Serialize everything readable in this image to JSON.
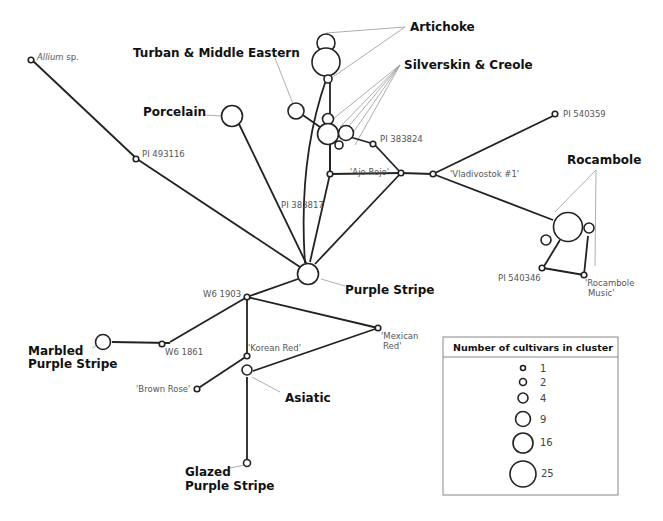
{
  "diagram": {
    "type": "minimum-spanning-network",
    "groups": {
      "artichoke": "Artichoke",
      "turban": "Turban & Middle Eastern",
      "silverskin": "Silverskin & Creole",
      "porcelain": "Porcelain",
      "rocambole": "Rocambole",
      "purple_stripe": "Purple Stripe",
      "marbled_1": "Marbled",
      "marbled_2": "Purple Stripe",
      "asiatic": "Asiatic",
      "glazed_1": "Glazed",
      "glazed_2": "Purple Stripe"
    },
    "accessions": {
      "allium": "Allium",
      "allium_suffix": " sp.",
      "pi493116": "PI 493116",
      "pi383824": "PI 383824",
      "ajo_rojo": "'Ajo Rojo'",
      "vladivostok": "'Vladivostok #1'",
      "pi540359": "PI 540359",
      "pi383817": "PI 383817",
      "pi540346": "PI 540346",
      "rocambole_music_1": "'Rocambole",
      "rocambole_music_2": "Music'",
      "w6_1903": "W6 1903",
      "w6_1861": "W6 1861",
      "korean_red": "'Korean Red'",
      "mexican_red_1": "'Mexican",
      "mexican_red_2": "Red'",
      "brown_rose": "'Brown Rose'"
    },
    "legend": {
      "title": "Number of cultivars in cluster",
      "sizes": [
        "1",
        "2",
        "4",
        "9",
        "16",
        "25"
      ]
    },
    "colors": {
      "edge": "#222222",
      "leader": "#999999",
      "label": "#555555"
    }
  }
}
